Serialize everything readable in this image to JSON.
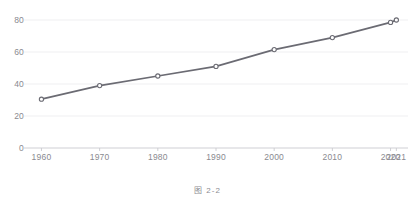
{
  "chart_data": {
    "type": "line",
    "title": "",
    "subtitle": "",
    "xlabel": "",
    "ylabel": "",
    "categories": [
      "1960",
      "1970",
      "1980",
      "1990",
      "2000",
      "2010",
      "2020",
      "2021"
    ],
    "x": [
      1960,
      1970,
      1980,
      1990,
      2000,
      2010,
      2020,
      2021
    ],
    "values": [
      30.5,
      39.0,
      45.0,
      51.0,
      61.5,
      69.0,
      78.5,
      80.0
    ],
    "series": [
      {
        "name": "",
        "values": [
          30.5,
          39.0,
          45.0,
          51.0,
          61.5,
          69.0,
          78.5,
          80.0
        ]
      }
    ],
    "ylim": [
      0,
      80
    ],
    "xlim": [
      1957,
      2023
    ],
    "yticks": [
      0,
      20,
      40,
      60,
      80
    ],
    "ytick_labels": [
      "0",
      "20",
      "40",
      "60",
      "80"
    ],
    "xtick_labels": [
      "1960",
      "1970",
      "1980",
      "1990",
      "2000",
      "2010",
      "2020",
      "2021"
    ],
    "grid": "horizontal",
    "legend": "none",
    "marker": "circle-open",
    "line_color": "#6b6b73",
    "marker_color": "#6b6b73",
    "marker_fill": "#ffffff",
    "grid_color": "#ebebed",
    "axis_color": "#c9c9cf",
    "tick_label_color": "#8a8a90",
    "background": "#ffffff"
  },
  "caption": {
    "text": "图 2-2"
  }
}
